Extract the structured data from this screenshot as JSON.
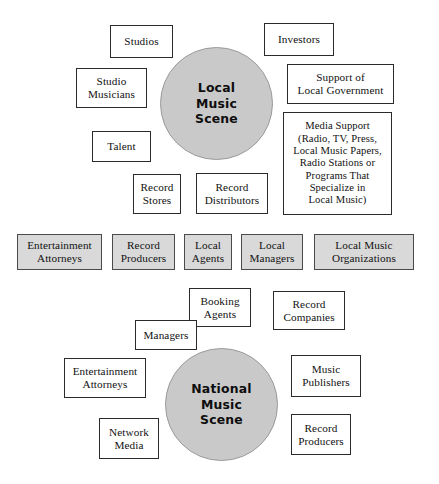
{
  "diagram": {
    "colors": {
      "hub_fill": "#c9c9c9",
      "shaded_fill": "#d9d9d9",
      "box_fill": "#ffffff",
      "stroke": "#2b2b2b",
      "background": "#ffffff"
    },
    "local": {
      "hub_label": "Local\nMusic\nScene",
      "satellites": [
        {
          "label": "Studios"
        },
        {
          "label": "Investors"
        },
        {
          "label": "Studio\nMusicians"
        },
        {
          "label": "Support of\nLocal Government"
        },
        {
          "label": "Talent"
        },
        {
          "label": "Media Support\n(Radio, TV, Press,\nLocal Music Papers,\nRadio Stations or\nPrograms That\nSpecialize in\nLocal Music)"
        },
        {
          "label": "Record\nStores"
        },
        {
          "label": "Record\nDistributors"
        }
      ]
    },
    "shared_row": {
      "items": [
        {
          "label": "Entertainment\nAttorneys"
        },
        {
          "label": "Record\nProducers"
        },
        {
          "label": "Local\nAgents"
        },
        {
          "label": "Local\nManagers"
        },
        {
          "label": "Local Music\nOrganizations"
        }
      ]
    },
    "national": {
      "hub_label": "National\nMusic\nScene",
      "satellites": [
        {
          "label": "Booking\nAgents"
        },
        {
          "label": "Record\nCompanies"
        },
        {
          "label": "Managers"
        },
        {
          "label": "Music\nPublishers"
        },
        {
          "label": "Entertainment\nAttorneys"
        },
        {
          "label": "Record\nProducers"
        },
        {
          "label": "Network\nMedia"
        }
      ]
    }
  }
}
